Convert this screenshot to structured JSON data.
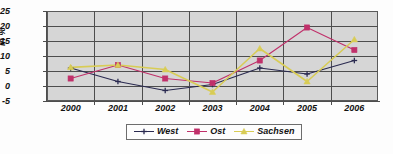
{
  "chart_data": {
    "type": "line",
    "title": "",
    "xlabel": "",
    "ylabel": "in %",
    "categories": [
      "2000",
      "2001",
      "2002",
      "2003",
      "2004",
      "2005",
      "2006"
    ],
    "ylim": [
      -5,
      25
    ],
    "ytick_values": [
      25,
      20,
      15,
      10,
      5,
      0,
      -5
    ],
    "ytick_labels": [
      "25",
      "20",
      "15",
      "10",
      "5",
      "0",
      "-5"
    ],
    "grid": true,
    "legend_position": "bottom",
    "plot_background": "#d6d6d6",
    "series": [
      {
        "name": "West",
        "color": "#2a2a50",
        "marker": "plus",
        "values": [
          6,
          1.5,
          -1.5,
          0.5,
          6,
          4,
          8.5
        ]
      },
      {
        "name": "Ost",
        "color": "#c0306a",
        "marker": "square",
        "values": [
          2.5,
          7,
          2.5,
          1,
          8.5,
          19.5,
          12
        ]
      },
      {
        "name": "Sachsen",
        "color": "#d8cc55",
        "marker": "triangle",
        "values": [
          6.2,
          7,
          5.5,
          -2,
          12.5,
          1.5,
          15.5
        ]
      }
    ]
  },
  "axis": {
    "y_label": "in %",
    "y_ticks": [
      "25",
      "20",
      "15",
      "10",
      "5",
      "0",
      "-5"
    ],
    "x_ticks": [
      "2000",
      "2001",
      "2002",
      "2003",
      "2004",
      "2005",
      "2006"
    ]
  },
  "legend": {
    "items": [
      {
        "label": "West",
        "color": "#2a2a50",
        "marker": "plus-marker-icon"
      },
      {
        "label": "Ost",
        "color": "#c0306a",
        "marker": "square-marker-icon"
      },
      {
        "label": "Sachsen",
        "color": "#d8cc55",
        "marker": "triangle-marker-icon"
      }
    ]
  }
}
